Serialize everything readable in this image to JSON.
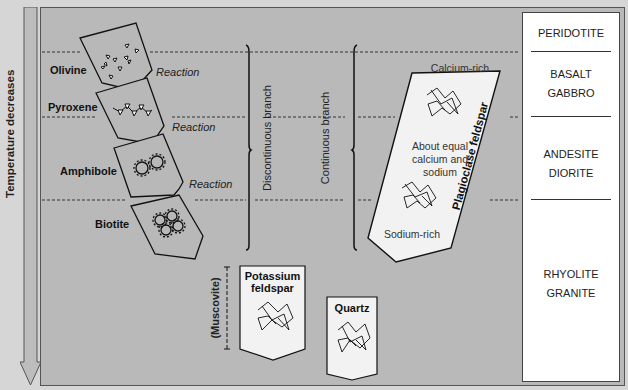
{
  "axis": {
    "label": "Temperature decreases",
    "arrow_icon": "down-arrow-icon"
  },
  "discontinuous": {
    "branch_label": "Discontinuous branch",
    "minerals": [
      {
        "name": "Olivine",
        "structure": "isolated tetrahedra"
      },
      {
        "name": "Pyroxene",
        "structure": "single chain"
      },
      {
        "name": "Amphibole",
        "structure": "double chain"
      },
      {
        "name": "Biotite",
        "structure": "sheet"
      }
    ],
    "reaction_label": "Reaction"
  },
  "continuous": {
    "branch_label": "Continuous branch",
    "mineral_label": "Plagioclase feldspar",
    "top_text": "Calcium-rich",
    "middle_text": [
      "About equal",
      "calcium and",
      "sodium"
    ],
    "bottom_text": "Sodium-rich"
  },
  "late_minerals": {
    "muscovite": "(Muscovite)",
    "potassium_feldspar": [
      "Potassium",
      "feldspar"
    ],
    "quartz": "Quartz"
  },
  "rock_types": [
    {
      "lines": [
        "PERIDOTITE"
      ]
    },
    {
      "lines": [
        "BASALT",
        "GABBRO"
      ]
    },
    {
      "lines": [
        "ANDESITE",
        "DIORITE"
      ]
    },
    {
      "lines": [
        "RHYOLITE",
        "GRANITE"
      ]
    }
  ],
  "colors": {
    "background": "#d6d6d6",
    "panel": "#b9b9b9",
    "plate_light": "#f2f2f2",
    "mineral_box": "#b5b5b5",
    "rock_column": "#ffffff"
  }
}
